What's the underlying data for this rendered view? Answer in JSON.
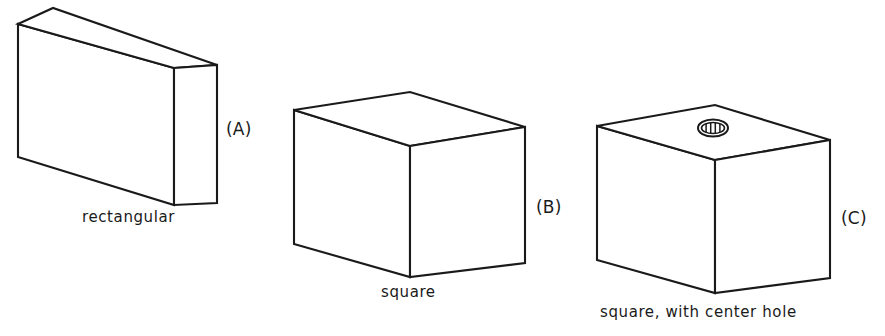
{
  "figure": {
    "background_color": "#ffffff",
    "line_color": "#1a1a1a",
    "width": 885,
    "height": 336
  },
  "shapes": [
    {
      "id": "A",
      "key_label": "(A)",
      "caption": "rectangular",
      "description": "rectangular block, thin slab seen in three-quarter view",
      "has_hole": false,
      "key_label_pos": {
        "x": 226,
        "y": 119
      },
      "caption_pos": {
        "x": 82,
        "y": 208
      },
      "geometry": {
        "front_face": "18,24 18,157 174,205 174,68",
        "top_face": "18,24 53,8 217,65 174,68",
        "right_face": "174,68 217,65 217,203 174,205"
      }
    },
    {
      "id": "B",
      "key_label": "(B)",
      "caption": "square",
      "description": "cube block, square cross-section",
      "has_hole": false,
      "key_label_pos": {
        "x": 536,
        "y": 197
      },
      "caption_pos": {
        "x": 381,
        "y": 283
      },
      "geometry": {
        "front_face": "294,110 294,244 410,277 410,146",
        "top_face": "294,110 410,92 525,127 410,146",
        "right_face": "410,146 525,127 525,263 410,277"
      }
    },
    {
      "id": "C",
      "key_label": "(C)",
      "caption": "square, with center hole",
      "description": "cube block with a circular center hole in the top face",
      "has_hole": true,
      "key_label_pos": {
        "x": 841,
        "y": 208
      },
      "caption_pos": {
        "x": 600,
        "y": 303
      },
      "geometry": {
        "front_face": "597,126 597,260 715,293 715,160",
        "top_face": "597,126 715,105 830,140 715,160",
        "right_face": "715,160 830,140 830,278 715,293"
      },
      "hole": {
        "center": {
          "x": 713,
          "y": 128
        },
        "outer_rx": 15,
        "outer_ry": 8.5,
        "inner_rx": 11.5,
        "inner_ry": 5.5,
        "tick_count": 4
      }
    }
  ]
}
